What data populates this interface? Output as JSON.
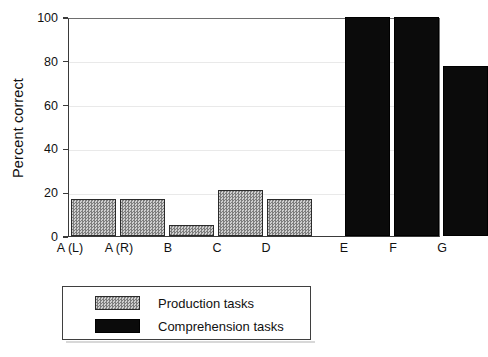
{
  "chart_data": {
    "type": "bar",
    "title": "",
    "xlabel": "",
    "ylabel": "Percent correct",
    "ylim": [
      0,
      100
    ],
    "yticks": [
      0,
      20,
      40,
      60,
      80,
      100
    ],
    "ytick_labels": [
      "0",
      "20",
      "40",
      "60",
      "80",
      "100"
    ],
    "grid": true,
    "legend_position": "below-plot",
    "categories": [
      "A (L)",
      "A (R)",
      "B",
      "C",
      "D",
      "E",
      "F",
      "G"
    ],
    "values": [
      17,
      17,
      5,
      21,
      17,
      100,
      100,
      77.5
    ],
    "groups": [
      {
        "name": "Production tasks",
        "color": "#a8a8a8",
        "pattern": "hatched-gray",
        "categories": [
          "A (L)",
          "A (R)",
          "B",
          "C",
          "D"
        ],
        "values": [
          17,
          17,
          5,
          21,
          17
        ]
      },
      {
        "name": "Comprehension tasks",
        "color": "#0b0b0b",
        "pattern": "solid-black",
        "categories": [
          "E",
          "F",
          "G"
        ],
        "values": [
          100,
          100,
          77.5
        ]
      }
    ],
    "bars": [
      {
        "label": "A (L)",
        "value": 17,
        "series": "Production tasks"
      },
      {
        "label": "A (R)",
        "value": 17,
        "series": "Production tasks"
      },
      {
        "label": "B",
        "value": 5,
        "series": "Production tasks"
      },
      {
        "label": "C",
        "value": 21,
        "series": "Production tasks"
      },
      {
        "label": "D",
        "value": 17,
        "series": "Production tasks"
      },
      {
        "label": "E",
        "value": 100,
        "series": "Comprehension tasks"
      },
      {
        "label": "F",
        "value": 100,
        "series": "Comprehension tasks"
      },
      {
        "label": "G",
        "value": 77.5,
        "series": "Comprehension tasks"
      }
    ],
    "legend": [
      {
        "label": "Production tasks",
        "swatch": "hatched-gray"
      },
      {
        "label": "Comprehension tasks",
        "swatch": "solid-black"
      }
    ]
  },
  "axis": {
    "y_title": "Percent correct",
    "y_tick_0": "0",
    "y_tick_1": "20",
    "y_tick_2": "40",
    "y_tick_3": "60",
    "y_tick_4": "80",
    "y_tick_5": "100"
  },
  "xlabels": {
    "l0": "A (L)",
    "l1": "A (R)",
    "l2": "B",
    "l3": "C",
    "l4": "D",
    "l5": "E",
    "l6": "F",
    "l7": "G"
  },
  "legend": {
    "row1": "Production tasks",
    "row2": "Comprehension tasks"
  }
}
